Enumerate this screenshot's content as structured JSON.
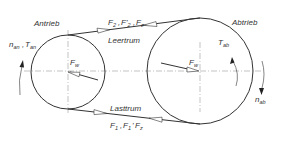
{
  "diagram": {
    "colors": {
      "line": "#333333",
      "centerline": "#999999",
      "background": "#ffffff"
    },
    "labels": {
      "drive": "Antrieb",
      "driven": "Abtrieb",
      "slack_side": "Leertrum",
      "tight_side": "Lasttrum"
    },
    "symbols": {
      "n_an": {
        "base": "n",
        "sub": "an"
      },
      "T_an": {
        "base": "T",
        "sub": "an"
      },
      "T_ab": {
        "base": "T",
        "sub": "ab"
      },
      "n_ab": {
        "base": "n",
        "sub": "ab"
      },
      "F_w_left": {
        "base": "F",
        "sub": "w"
      },
      "F_w_right": {
        "base": "F",
        "sub": "w"
      }
    },
    "top_forces": {
      "f1": {
        "base": "F",
        "sub": "2"
      },
      "sep1": ",",
      "f2": {
        "base": "F'",
        "sub": "2"
      },
      "sep2": ",",
      "f3": {
        "base": "F",
        "sub": "z"
      }
    },
    "bottom_forces": {
      "f1": {
        "base": "F",
        "sub": "1"
      },
      "sep1": ",",
      "f2": {
        "base": "F",
        "sub": "1"
      },
      "sep2": "'",
      "f3": {
        "base": "F",
        "sub": "z"
      }
    },
    "pulleys": [
      {
        "name": "drive-pulley",
        "cx": 68,
        "cy": 71,
        "r": 37
      },
      {
        "name": "driven-pulley",
        "cx": 200,
        "cy": 71,
        "r": 53
      }
    ]
  }
}
